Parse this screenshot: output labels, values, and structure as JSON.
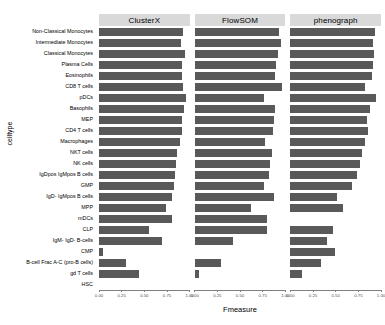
{
  "chart_data": {
    "type": "bar",
    "orientation": "horizontal",
    "title": "",
    "xlabel": "Fmeasure",
    "ylabel": "celltype",
    "xlim": [
      0,
      1
    ],
    "xticks": [
      "0.00",
      "0.25",
      "0.50",
      "0.75",
      "1.00"
    ],
    "xtick_values": [
      0,
      0.25,
      0.5,
      0.75,
      1
    ],
    "grid": false,
    "legend": "none",
    "facets": [
      "ClusterX",
      "FlowSOM",
      "phenograph"
    ],
    "categories": [
      "Non-Classical Monocytes",
      "Intermediate Monocytes",
      "Classical Monocytes",
      "Plasma Cells",
      "Eosinophils",
      "CD8 T cells",
      "pDCs",
      "Basophils",
      "MEP",
      "CD4 T cells",
      "Macrophages",
      "NKT cells",
      "NK cells",
      "IgDpos IgMpos B cells",
      "GMP",
      "IgD- IgMpos B cells",
      "MPP",
      "mDCs",
      "CLP",
      "IgM- IgD- B-cells",
      "CMP",
      "B-cell Frac A-C (pro-B cells)",
      "gd T cells",
      "HSC"
    ],
    "series": [
      {
        "name": "ClusterX",
        "values": [
          0.93,
          0.9,
          0.95,
          0.91,
          0.92,
          0.93,
          0.96,
          0.94,
          0.92,
          0.91,
          0.89,
          0.86,
          0.85,
          0.84,
          0.83,
          0.81,
          0.74,
          0.8,
          0.55,
          0.69,
          0.04,
          0.3,
          0.44,
          0.0
        ]
      },
      {
        "name": "FlowSOM",
        "values": [
          0.93,
          0.95,
          0.92,
          0.9,
          0.89,
          0.96,
          0.77,
          0.89,
          0.88,
          0.86,
          0.78,
          0.85,
          0.83,
          0.82,
          0.76,
          0.88,
          0.62,
          0.8,
          0.8,
          0.42,
          0.0,
          0.29,
          0.05,
          0.0
        ]
      },
      {
        "name": "phenograph",
        "values": [
          0.93,
          0.91,
          0.92,
          0.91,
          0.9,
          0.82,
          0.95,
          0.88,
          0.85,
          0.86,
          0.82,
          0.79,
          0.77,
          0.74,
          0.68,
          0.52,
          0.58,
          0.0,
          0.47,
          0.4,
          0.49,
          0.34,
          0.13,
          0.0
        ]
      }
    ]
  },
  "colors": {
    "bar": "#595959",
    "strip_background": "#d9d9d9",
    "axis": "#808080",
    "text": "#000000",
    "tick_text": "#4d4d4d",
    "panel_background": "#ffffff"
  }
}
